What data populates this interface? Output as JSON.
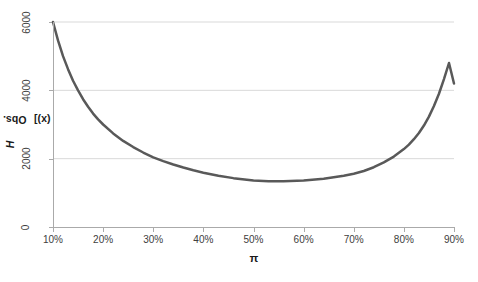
{
  "chart_data": {
    "type": "line",
    "title": "",
    "subtitle": "",
    "xlabel": "π",
    "ylabel": "Obs. Info [-H(x)]",
    "ylabel_parts": {
      "prefix": "Obs. Info [-",
      "italic": "H",
      "suffix": "(x)]"
    },
    "xlim": [
      0.1,
      0.9
    ],
    "ylim": [
      0,
      6000
    ],
    "xticks": [
      0.1,
      0.2,
      0.3,
      0.4,
      0.5,
      0.6,
      0.7,
      0.8,
      0.9
    ],
    "xtick_labels": [
      "10%",
      "20%",
      "30%",
      "40%",
      "50%",
      "60%",
      "70%",
      "80%",
      "90%"
    ],
    "yticks": [
      0,
      2000,
      4000,
      6000
    ],
    "ytick_labels": [
      "0",
      "2000",
      "4000",
      "6000"
    ],
    "grid": {
      "horizontal": true,
      "vertical": false
    },
    "legend": null,
    "annotations": [],
    "series": [
      {
        "name": "Obs. Info",
        "color": "#595959",
        "line_width": 2.5,
        "x": [
          0.1,
          0.11,
          0.12,
          0.13,
          0.14,
          0.15,
          0.16,
          0.17,
          0.18,
          0.19,
          0.2,
          0.22,
          0.24,
          0.26,
          0.28,
          0.3,
          0.32,
          0.34,
          0.36,
          0.38,
          0.4,
          0.43,
          0.46,
          0.5,
          0.53,
          0.56,
          0.6,
          0.64,
          0.68,
          0.7,
          0.72,
          0.74,
          0.76,
          0.78,
          0.8,
          0.81,
          0.82,
          0.83,
          0.84,
          0.85,
          0.86,
          0.87,
          0.88,
          0.89,
          0.9
        ],
        "y": [
          6000,
          5460,
          5000,
          4620,
          4280,
          4000,
          3740,
          3520,
          3320,
          3150,
          3000,
          2740,
          2520,
          2340,
          2180,
          2040,
          1930,
          1830,
          1740,
          1660,
          1590,
          1500,
          1430,
          1360,
          1340,
          1340,
          1360,
          1410,
          1500,
          1560,
          1640,
          1750,
          1890,
          2060,
          2280,
          2410,
          2570,
          2750,
          2970,
          3230,
          3540,
          3900,
          4330,
          4800,
          4200
        ]
      }
    ],
    "curve_formula": {
      "description": "n / (pi * (1 - pi))",
      "n": 540
    },
    "colors": {
      "curve": "#595959",
      "gridline": "#d9d9d9",
      "axis": "#aaaaaa",
      "tick_text": "#404040",
      "title_text": "#1a1a1a",
      "background": "#ffffff"
    }
  }
}
